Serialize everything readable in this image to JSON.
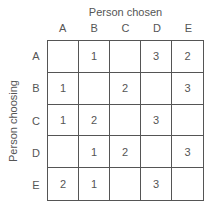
{
  "labels": {
    "column_title": "Person chosen",
    "row_title": "Person choosing"
  },
  "columns": [
    "A",
    "B",
    "C",
    "D",
    "E"
  ],
  "rows": [
    {
      "label": "A",
      "cells": [
        "",
        "1",
        "",
        "3",
        "2"
      ]
    },
    {
      "label": "B",
      "cells": [
        "1",
        "",
        "2",
        "",
        "3"
      ]
    },
    {
      "label": "C",
      "cells": [
        "1",
        "2",
        "",
        "3",
        ""
      ]
    },
    {
      "label": "D",
      "cells": [
        "",
        "1",
        "2",
        "",
        "3"
      ]
    },
    {
      "label": "E",
      "cells": [
        "2",
        "1",
        "",
        "3",
        ""
      ]
    }
  ]
}
